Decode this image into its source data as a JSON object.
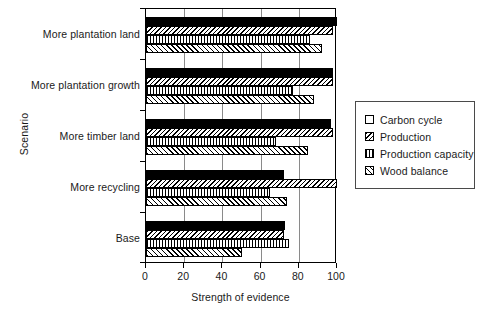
{
  "chart_data": {
    "type": "bar",
    "orientation": "horizontal",
    "title": "",
    "xlabel": "Strength of evidence",
    "ylabel": "Scenario",
    "xlim": [
      0,
      100
    ],
    "xticks": [
      0,
      20,
      40,
      60,
      80,
      100
    ],
    "xtick_labels": [
      "0",
      "20",
      "40",
      "60",
      "80",
      "100"
    ],
    "grid": "vertical",
    "legend_position": "right",
    "categories": [
      "More plantation land",
      "More plantation growth",
      "More timber land",
      "More recycling",
      "Base"
    ],
    "series": [
      {
        "name": "Carbon cycle",
        "pattern": "solid-black",
        "values": [
          100,
          98,
          97,
          72,
          73
        ]
      },
      {
        "name": "Production",
        "pattern": "backslash-hatch",
        "values": [
          98,
          98,
          98,
          100,
          72
        ]
      },
      {
        "name": "Production capacity",
        "pattern": "vertical-hatch",
        "values": [
          86,
          77,
          68,
          65,
          75
        ]
      },
      {
        "name": "Wood balance",
        "pattern": "slash-hatch",
        "values": [
          92,
          88,
          85,
          74,
          50
        ]
      }
    ]
  },
  "legend": {
    "items": [
      {
        "label": "Carbon cycle",
        "pattern": "solid-black"
      },
      {
        "label": "Production",
        "pattern": "backslash-hatch"
      },
      {
        "label": "Production capacity",
        "pattern": "vertical-hatch"
      },
      {
        "label": "Wood balance",
        "pattern": "slash-hatch"
      }
    ]
  },
  "colors": {
    "series_fill": "#000000",
    "axis": "#000000",
    "gridline": "#8a8a8a",
    "background": "#ffffff"
  }
}
